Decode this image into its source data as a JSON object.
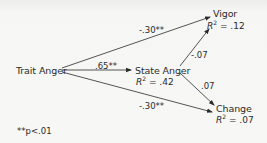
{
  "diagram": {
    "type": "path-diagram",
    "nodes": {
      "trait_anger": {
        "label": "Trait Anger"
      },
      "state_anger": {
        "label": "State Anger",
        "r2_label": "R",
        "r2_sup": "2",
        "r2_value": " = .42"
      },
      "vigor": {
        "label": "Vigor",
        "r2_label": "R",
        "r2_sup": "2",
        "r2_value": " = .12"
      },
      "change": {
        "label": "Change",
        "r2_label": "R",
        "r2_sup": "2",
        "r2_value": " = .07"
      }
    },
    "edges": [
      {
        "from": "Trait Anger",
        "to": "Vigor",
        "coef": "-.30**"
      },
      {
        "from": "Trait Anger",
        "to": "State Anger",
        "coef": ".65**"
      },
      {
        "from": "Trait Anger",
        "to": "Change",
        "coef": "-.30**"
      },
      {
        "from": "State Anger",
        "to": "Vigor",
        "coef": "-.07"
      },
      {
        "from": "State Anger",
        "to": "Change",
        "coef": ".07"
      }
    ],
    "footnote": "**p<.01",
    "colors": {
      "background": "#f3f3f1",
      "ink": "#2b2b2b"
    }
  }
}
